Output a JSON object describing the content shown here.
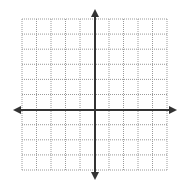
{
  "diagram": {
    "type": "coordinate-plane",
    "grid": {
      "left": 22,
      "top": 19,
      "right": 167,
      "bottom": 170,
      "columns": 10,
      "rows": 10,
      "line_style": "dotted",
      "line_color": "#9a9a9a"
    },
    "axes": {
      "color": "#333333",
      "x_axis": {
        "y": 110,
        "from_x": 13,
        "to_x": 177,
        "arrows": [
          "left",
          "right"
        ]
      },
      "y_axis": {
        "x": 95,
        "from_y": 9,
        "to_y": 180,
        "arrows": [
          "up",
          "down"
        ]
      },
      "origin_column_index": 5,
      "origin_row_index": 6
    },
    "background": "#ffffff"
  }
}
